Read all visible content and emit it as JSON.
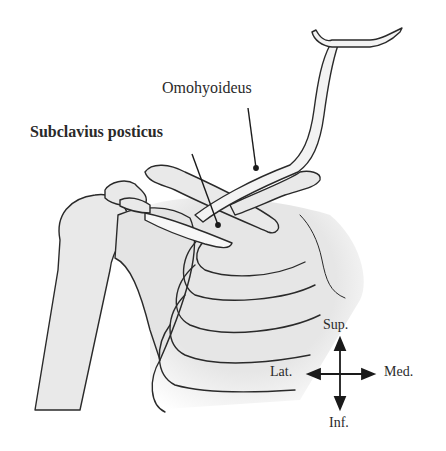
{
  "diagram": {
    "labels": {
      "omohyoideus": "Omohyoideus",
      "subclavius_posticus": "Subclavius posticus"
    },
    "orientation": {
      "superior": "Sup.",
      "inferior": "Inf.",
      "lateral": "Lat.",
      "medial": "Med."
    },
    "colors": {
      "ink": "#2a2a2a",
      "bone_fill": "#e9e9e9",
      "muscle_fill": "#f7f7f7",
      "background": "#ffffff"
    }
  }
}
